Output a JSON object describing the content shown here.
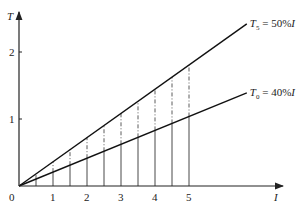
{
  "chart_data": {
    "type": "line",
    "title": "",
    "xlabel": "I",
    "ylabel": "T",
    "origin_label": "0",
    "x_ticks": [
      "1",
      "2",
      "3",
      "4",
      "5"
    ],
    "y_ticks": [
      "1",
      "2"
    ],
    "xlim": [
      0,
      7.8
    ],
    "ylim": [
      0,
      2.6
    ],
    "grid": false,
    "series": [
      {
        "name": "T5 = 50%I",
        "label_main": "T",
        "label_sub": "5",
        "label_rest": " = 50%I",
        "x": [
          0,
          6.7
        ],
        "y": [
          0,
          2.42
        ],
        "style": "solid"
      },
      {
        "name": "T0 = 40%I",
        "label_main": "T",
        "label_sub": "0",
        "label_rest": " = 40%I",
        "x": [
          0,
          6.7
        ],
        "y": [
          0,
          1.39
        ],
        "style": "solid"
      }
    ],
    "vertical_markers": {
      "x": [
        0.5,
        1,
        1.5,
        2,
        2.5,
        3,
        3.5,
        4,
        4.5,
        5
      ],
      "below_lower_line": "solid",
      "between_lines": "dash-dot"
    }
  }
}
